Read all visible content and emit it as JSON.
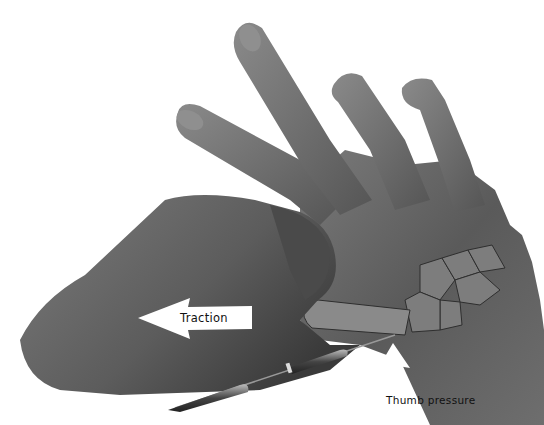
{
  "figure": {
    "labels": {
      "traction": "Traction",
      "thumb_pressure": "Thumb pressure"
    },
    "arrows": {
      "traction_direction": "left",
      "thumb_pressure_direction": "up"
    },
    "colors": {
      "background": "#ffffff",
      "skin_dark": "#4a4a4a",
      "skin_mid": "#6b6b6b",
      "skin_light": "#8c8c8c",
      "bone": "#9a9a9a",
      "arrow_fill": "#ffffff",
      "text": "#111111"
    }
  }
}
